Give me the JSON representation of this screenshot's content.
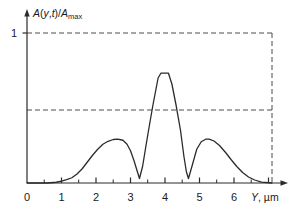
{
  "chart_data": {
    "type": "line",
    "title": "",
    "subtitle": "",
    "xlabel": "Y, µm",
    "xlabel_parts": {
      "variable": "Y",
      "separator": ", ",
      "unit": "µm"
    },
    "ylabel": "A(y,t)/Amax",
    "ylabel_parts": {
      "a1": "A",
      "open": "(",
      "v1": "y",
      "comma": ",",
      "v2": "t",
      "close": ")",
      "slash": "/",
      "a2": "A",
      "sub": "max"
    },
    "xlim": [
      0,
      7.5
    ],
    "ylim": [
      0,
      1.12
    ],
    "xticks": [
      0,
      1,
      2,
      3,
      4,
      5,
      6
    ],
    "xtick_labels": [
      "0",
      "1",
      "2",
      "3",
      "4",
      "5",
      "6"
    ],
    "yticks": [
      1
    ],
    "ytick_labels": [
      "1"
    ],
    "grid": false,
    "legend": null,
    "legend_position": "none",
    "line_color": "#2b2b2b",
    "axis_color": "#2b2b2b",
    "guide_color": "#4d4d4d",
    "guides": {
      "horizontal": [
        {
          "y": 1.0,
          "x_from": 0.0,
          "x_to": 7.1,
          "style": "dashed",
          "label": "1"
        },
        {
          "y": 0.49,
          "x_from": 0.0,
          "x_to": 7.1,
          "style": "dashed",
          "label": ""
        }
      ],
      "vertical": [
        {
          "x": 7.1,
          "y_from": 0.0,
          "y_to": 1.0,
          "style": "dashed",
          "label": ""
        }
      ]
    },
    "annotations": [
      {
        "text": "central main peak",
        "x": 4.0,
        "y": 0.73
      },
      {
        "text": "left side peak",
        "x": 2.63,
        "y": 0.29
      },
      {
        "text": "right side peak",
        "x": 5.25,
        "y": 0.29
      }
    ],
    "x": [
      0.0,
      0.6,
      0.85,
      1.0,
      1.15,
      1.3,
      1.45,
      1.6,
      1.75,
      1.9,
      2.05,
      2.2,
      2.35,
      2.5,
      2.63,
      2.78,
      2.9,
      3.0,
      3.1,
      3.2,
      3.26,
      3.35,
      3.5,
      3.65,
      3.8,
      3.88,
      4.1,
      4.2,
      4.32,
      4.45,
      4.55,
      4.62,
      4.68,
      4.78,
      4.92,
      5.05,
      5.18,
      5.28,
      5.42,
      5.58,
      5.75,
      5.92,
      6.08,
      6.25,
      6.42,
      6.6,
      6.8,
      7.1
    ],
    "y": [
      0.0,
      0.0,
      0.005,
      0.013,
      0.022,
      0.035,
      0.06,
      0.095,
      0.14,
      0.185,
      0.225,
      0.258,
      0.278,
      0.29,
      0.293,
      0.285,
      0.258,
      0.215,
      0.15,
      0.075,
      0.03,
      0.11,
      0.32,
      0.52,
      0.7,
      0.732,
      0.732,
      0.66,
      0.52,
      0.35,
      0.175,
      0.075,
      0.03,
      0.11,
      0.225,
      0.275,
      0.292,
      0.293,
      0.28,
      0.25,
      0.205,
      0.155,
      0.11,
      0.07,
      0.04,
      0.02,
      0.006,
      0.0
    ]
  },
  "axes": {
    "x_arrow": true,
    "y_arrow": true
  }
}
